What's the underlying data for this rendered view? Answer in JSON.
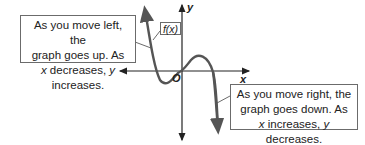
{
  "graph": {
    "function_label": "f(x)",
    "x_axis_label": "x",
    "y_axis_label": "y",
    "origin_label": "O",
    "curve_color": "#555555",
    "axis_color": "#222222"
  },
  "callouts": {
    "left": {
      "line1": "As you move left, the",
      "line2": "graph goes up. As",
      "line3_var1": "x",
      "line3_mid": " decreases, ",
      "line3_var2": "y",
      "line3_end": " increases."
    },
    "right": {
      "line1": "As you move right, the",
      "line2": "graph goes down. As",
      "line3_var1": "x",
      "line3_mid": " increases, ",
      "line3_var2": "y",
      "line3_end": " decreases."
    }
  }
}
